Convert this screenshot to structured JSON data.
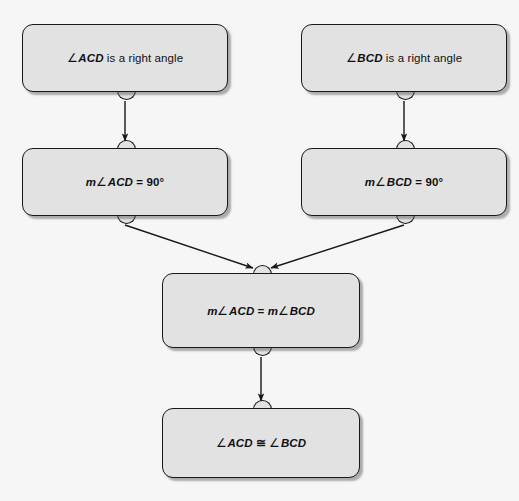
{
  "diagram": {
    "type": "flow-proof",
    "background_color": "#f6f6f6",
    "node_fill_color": "#e2e2e2",
    "node_border_color": "#17181a",
    "nodes": [
      {
        "id": "n1",
        "text": "∠ACD is a right angle",
        "angle_symbol": "∠",
        "variable": "ACD",
        "rest": " is a right angle",
        "x": 22,
        "y": 24,
        "w": 206,
        "h": 68
      },
      {
        "id": "n2",
        "text": "∠BCD is a right angle",
        "angle_symbol": "∠",
        "variable": "BCD",
        "rest": " is a right angle",
        "x": 301,
        "y": 24,
        "w": 206,
        "h": 68
      },
      {
        "id": "n3",
        "text": "m∠ACD = 90°",
        "lhs_m": "m",
        "angle_symbol": "∠",
        "variable": "ACD",
        "operator": " = ",
        "value": "90°",
        "x": 22,
        "y": 148,
        "w": 206,
        "h": 68
      },
      {
        "id": "n4",
        "text": "m∠BCD = 90°",
        "lhs_m": "m",
        "angle_symbol": "∠",
        "variable": "BCD",
        "operator": " = ",
        "value": "90°",
        "x": 301,
        "y": 148,
        "w": 206,
        "h": 68
      },
      {
        "id": "n5",
        "text": "m∠ACD = m∠BCD",
        "lhs_m": "m",
        "angle_symbol": "∠",
        "variable": "ACD",
        "operator": " = ",
        "rhs_m": "m",
        "variable2": "BCD",
        "x": 162,
        "y": 273,
        "w": 198,
        "h": 75
      },
      {
        "id": "n6",
        "text": "∠ACD ≅ ∠BCD",
        "angle_symbol": "∠",
        "variable": "ACD",
        "operator": " ≅ ",
        "variable2": "BCD",
        "x": 162,
        "y": 408,
        "w": 198,
        "h": 70
      }
    ],
    "edges": [
      {
        "id": "e1",
        "from": "n1",
        "to": "n3",
        "kind": "vertical",
        "arrow": true
      },
      {
        "id": "e2",
        "from": "n2",
        "to": "n4",
        "kind": "vertical",
        "arrow": true
      },
      {
        "id": "e3",
        "from": "n3",
        "to": "n5",
        "kind": "diagonal",
        "arrow": true
      },
      {
        "id": "e4",
        "from": "n4",
        "to": "n5",
        "kind": "diagonal",
        "arrow": true
      },
      {
        "id": "e5",
        "from": "n5",
        "to": "n6",
        "kind": "vertical",
        "arrow": true
      }
    ]
  }
}
